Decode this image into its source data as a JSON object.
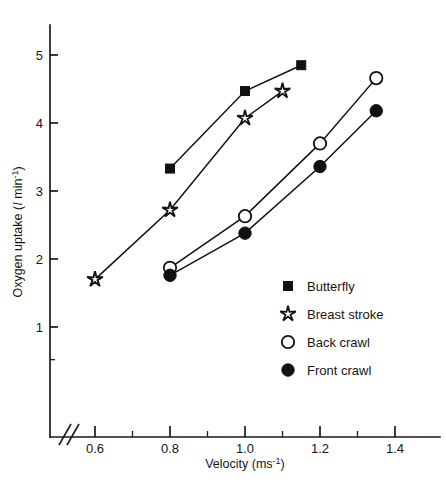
{
  "figure": {
    "background_color": "#ffffff",
    "ink_color": "#111111"
  },
  "axes": {
    "x": {
      "title_prefix": "Velocity (ms",
      "title_exponent": "-1",
      "title_suffix": ")",
      "tick_labels": [
        "0.6",
        "0.8",
        "1.0",
        "1.2",
        "1.4"
      ],
      "tick_values": [
        0.6,
        0.8,
        1.0,
        1.2,
        1.4
      ],
      "minor_tick_values": [
        0.7,
        0.9,
        1.1,
        1.3
      ],
      "range": [
        0.53,
        1.5
      ],
      "has_axis_break": true,
      "break_symbol": "//"
    },
    "y": {
      "title_prefix": "Oxygen uptake (",
      "title_unit": "l",
      "title_mid": " min",
      "title_exponent": "-1",
      "title_suffix": ")",
      "tick_labels": [
        "1",
        "2",
        "3",
        "4",
        "5"
      ],
      "tick_values": [
        1,
        2,
        3,
        4,
        5
      ],
      "range": [
        0.35,
        5.45
      ]
    }
  },
  "legend": {
    "position": "inside-right",
    "items": [
      {
        "label": "Butterfly",
        "marker": "filled-square",
        "marker_name": "filled-square-marker"
      },
      {
        "label": "Breast stroke",
        "marker": "open-star",
        "marker_name": "open-star-marker"
      },
      {
        "label": "Back crawl",
        "marker": "open-circle",
        "marker_name": "open-circle-marker"
      },
      {
        "label": "Front crawl",
        "marker": "filled-circle",
        "marker_name": "filled-circle-marker"
      }
    ]
  },
  "caption": {
    "text": ""
  },
  "chart_data": {
    "type": "line",
    "title": "",
    "subtitle": "",
    "xlabel": "Velocity (ms-1)",
    "ylabel": "Oxygen uptake (l min-1)",
    "xlim": [
      0.53,
      1.5
    ],
    "ylim": [
      0.35,
      5.45
    ],
    "grid": false,
    "legend_position": "inside-right",
    "xticks": [
      0.6,
      0.8,
      1.0,
      1.2,
      1.4
    ],
    "yticks": [
      1,
      2,
      3,
      4,
      5
    ],
    "series": [
      {
        "name": "Butterfly",
        "marker": "filled-square",
        "x": [
          0.8,
          1.0,
          1.15
        ],
        "y": [
          3.33,
          4.47,
          4.85
        ]
      },
      {
        "name": "Breast stroke",
        "marker": "open-star",
        "x": [
          0.6,
          0.8,
          1.0,
          1.1
        ],
        "y": [
          1.7,
          2.72,
          4.07,
          4.47
        ]
      },
      {
        "name": "Back crawl",
        "marker": "open-circle",
        "x": [
          0.8,
          1.0,
          1.2,
          1.35
        ],
        "y": [
          1.87,
          2.63,
          3.7,
          4.66
        ]
      },
      {
        "name": "Front crawl",
        "marker": "filled-circle",
        "x": [
          0.8,
          1.0,
          1.2,
          1.35
        ],
        "y": [
          1.76,
          2.38,
          3.36,
          4.18
        ]
      }
    ]
  }
}
